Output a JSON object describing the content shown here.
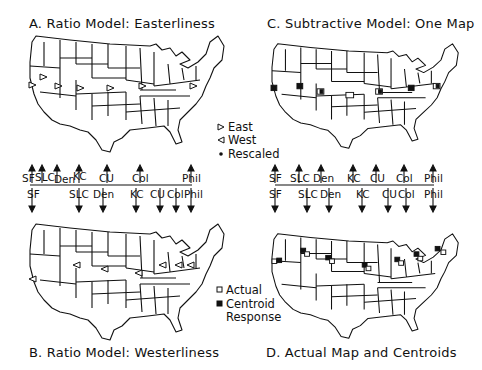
{
  "panels": {
    "a": {
      "title": "A. Ratio Model: Easterliness"
    },
    "b": {
      "title": "B. Ratio Model: Westerliness"
    },
    "c": {
      "title": "C. Subtractive Model: One Map"
    },
    "d": {
      "title": "D. Actual Map and Centroids"
    }
  },
  "legend_top": {
    "items": [
      {
        "symbol": "triangle-right-icon",
        "label": "East"
      },
      {
        "symbol": "triangle-left-icon",
        "label": "West"
      },
      {
        "symbol": "dot-icon",
        "label": "Rescaled"
      }
    ]
  },
  "legend_bottom": {
    "items": [
      {
        "symbol": "open-square-icon",
        "label": "Actual"
      },
      {
        "symbol": "filled-square-icon",
        "label": "Centroid"
      },
      {
        "symbol": "",
        "label": "Response"
      }
    ]
  },
  "left_band": {
    "top_labels": [
      "SF",
      "SLC",
      "Den",
      "KC",
      "CU",
      "Col",
      "Phil"
    ],
    "bottom_labels": [
      "SF",
      "SLC",
      "Den",
      "KC",
      "CU",
      "Col",
      "Phil"
    ]
  },
  "right_band": {
    "top_labels": [
      "SF",
      "SLC",
      "Den",
      "KC",
      "CU",
      "Col",
      "Phil"
    ],
    "bottom_labels": [
      "SF",
      "SLC",
      "Den",
      "KC",
      "CU",
      "Col",
      "Phil"
    ]
  },
  "cities": [
    "San Francisco (SF)",
    "Salt Lake City (SLC)",
    "Denver (Den)",
    "Kansas City (KC)",
    "Champaign-Urbana (CU)",
    "Columbus (Col)",
    "Philadelphia (Phil)"
  ]
}
